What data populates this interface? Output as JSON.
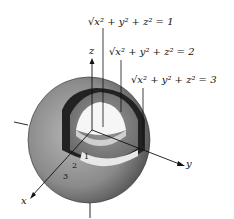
{
  "figure": {
    "equations": [
      {
        "label": "√x² + y² + z² = 1",
        "value": 1
      },
      {
        "label": "√x² + y² + z² = 2",
        "value": 2
      },
      {
        "label": "√x² + y² + z² = 3",
        "value": 3
      }
    ],
    "axes": {
      "x": "x",
      "y": "y",
      "z": "z"
    },
    "ticks": [
      "1",
      "2",
      "3"
    ],
    "colors": {
      "shell_outer": "#8a8a8a",
      "shell_inner_dark": "#2a2a2a",
      "inner_sphere": "#f4f4f4",
      "ink": "#111111"
    }
  }
}
